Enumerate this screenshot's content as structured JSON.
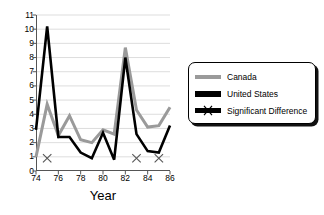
{
  "chart_data": {
    "type": "line",
    "title": "",
    "xlabel": "Year",
    "ylabel": "",
    "x": [
      74,
      75,
      76,
      77,
      78,
      79,
      80,
      81,
      82,
      83,
      84,
      85,
      86
    ],
    "x_tick_labels": [
      "74",
      "76",
      "78",
      "80",
      "82",
      "84",
      "86"
    ],
    "x_tick_values": [
      74,
      76,
      78,
      80,
      82,
      84,
      86
    ],
    "xlim": [
      74,
      86
    ],
    "ylim": [
      0,
      11
    ],
    "y_tick_labels": [
      "0",
      "1",
      "2",
      "3",
      "4",
      "5",
      "6",
      "7",
      "8",
      "9",
      "10",
      "11"
    ],
    "y_tick_values": [
      0,
      1,
      2,
      3,
      4,
      5,
      6,
      7,
      8,
      9,
      10,
      11
    ],
    "grid": true,
    "grid_axis": "y",
    "legend_position": "right",
    "series": [
      {
        "name": "Canada",
        "color": "#9a9a9a",
        "values": [
          1.0,
          4.7,
          2.5,
          3.9,
          2.2,
          2.0,
          2.9,
          2.6,
          8.7,
          4.3,
          3.1,
          3.2,
          4.5
        ]
      },
      {
        "name": "United States",
        "color": "#000000",
        "values": [
          2.9,
          10.2,
          2.4,
          2.4,
          1.3,
          0.9,
          2.7,
          0.8,
          8.0,
          2.6,
          1.4,
          1.3,
          3.2
        ]
      }
    ],
    "markers": {
      "name": "Significant Difference",
      "symbol": "x",
      "color": "#555555",
      "y": 0.9,
      "x": [
        75,
        83,
        85
      ]
    }
  },
  "legend": {
    "items": [
      {
        "label": "Canada",
        "swatch": "canada-swatch"
      },
      {
        "label": "United States",
        "swatch": "united-states-swatch"
      },
      {
        "label": "Significant Difference",
        "swatch": "significant-difference-swatch"
      }
    ]
  }
}
